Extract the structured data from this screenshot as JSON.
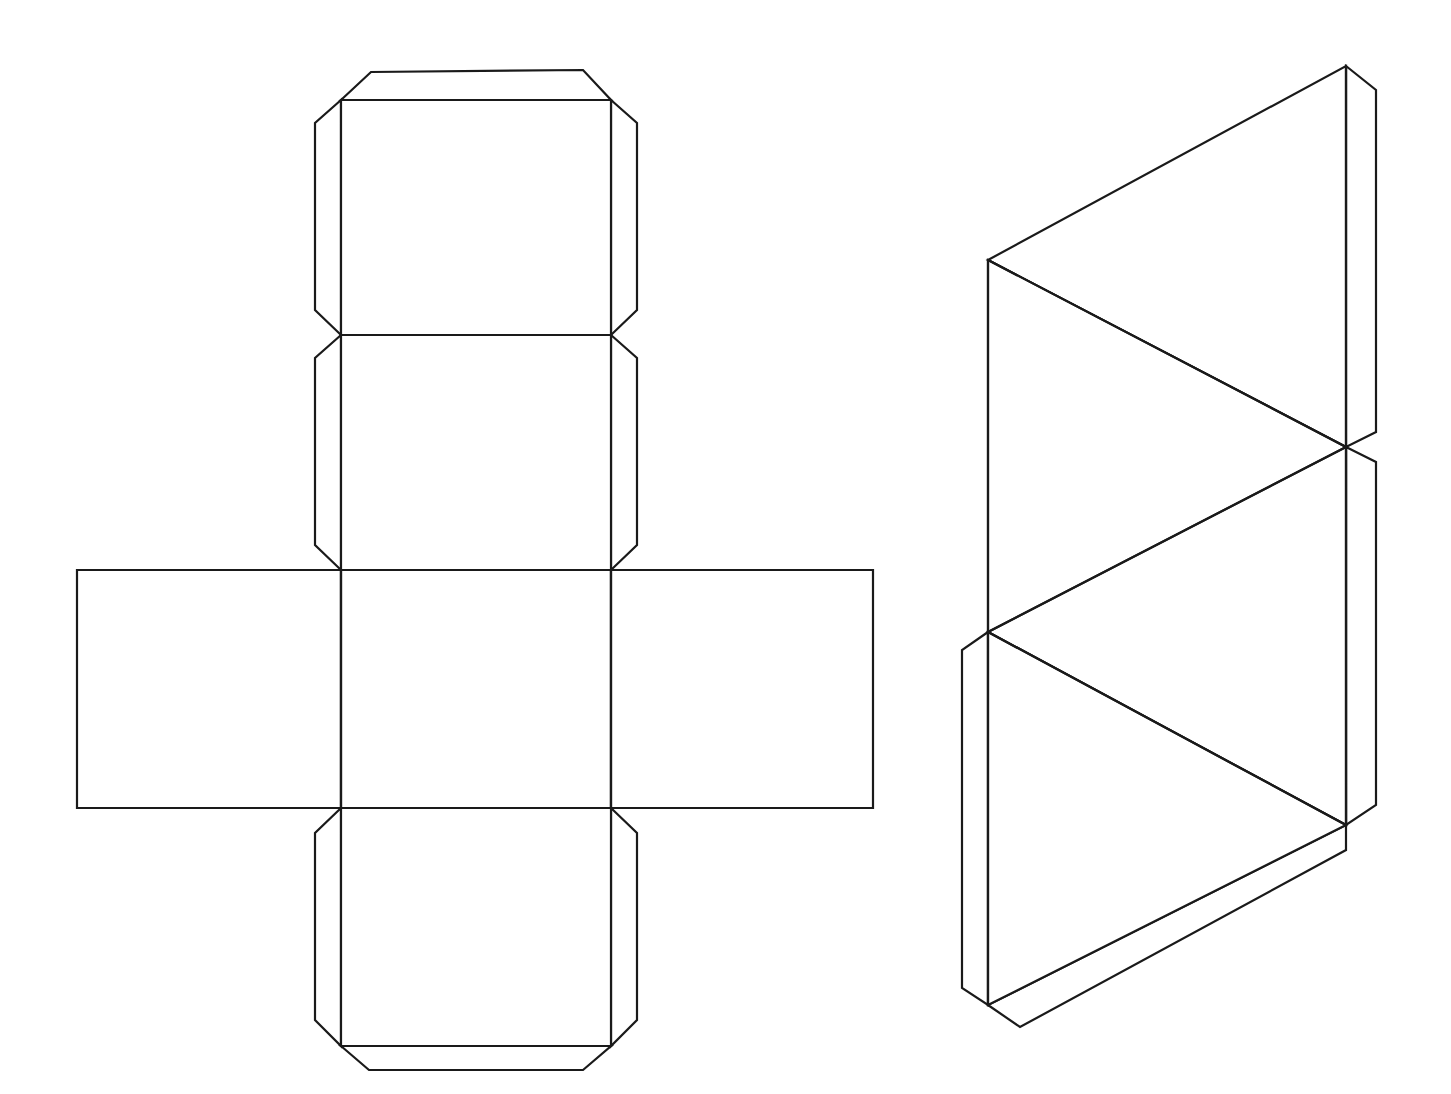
{
  "page": {
    "width": 1451,
    "height": 1094,
    "background_color": "#ffffff",
    "line_color": "#1a1a1a",
    "fill_color": "#ffffff"
  },
  "figures": [
    {
      "id": "cube-net",
      "name": "Cube Net",
      "shape": "cross-shaped cube net",
      "face_count": 6,
      "stroke_width": 2.2,
      "faces": [
        {
          "id": "cube-face-top",
          "name": "top-square",
          "points": "341,100 611,100 611,335 341,335"
        },
        {
          "id": "cube-face-upper-middle",
          "name": "upper-middle-square",
          "points": "341,335 611,335 611,570 341,570"
        },
        {
          "id": "cube-face-left",
          "name": "left-square",
          "points": "77,570 341,570 341,808 77,808"
        },
        {
          "id": "cube-face-center",
          "name": "center-square",
          "points": "341,570 611,570 611,808 341,808"
        },
        {
          "id": "cube-face-right",
          "name": "right-square",
          "points": "611,570 873,570 873,808 611,808"
        },
        {
          "id": "cube-face-bottom",
          "name": "bottom-square",
          "points": "341,808 611,808 611,1046 341,1046"
        }
      ],
      "tabs": [
        {
          "id": "cube-tab-top",
          "name": "top-glue-tab",
          "points": "341,100 371,72 583,70 611,100"
        },
        {
          "id": "cube-tab-top-left",
          "name": "top-left-glue-tab",
          "points": "341,100 315,123 315,310 341,335"
        },
        {
          "id": "cube-tab-top-right",
          "name": "top-right-glue-tab",
          "points": "611,100 637,123 637,310 611,335"
        },
        {
          "id": "cube-tab-upper-left",
          "name": "upper-middle-left-glue-tab",
          "points": "341,335 315,358 315,545 341,570"
        },
        {
          "id": "cube-tab-upper-right",
          "name": "upper-middle-right-glue-tab",
          "points": "611,335 637,358 637,545 611,570"
        },
        {
          "id": "cube-tab-bottom-left",
          "name": "bottom-left-glue-tab",
          "points": "341,808 315,833 315,1020 341,1046"
        },
        {
          "id": "cube-tab-bottom-right",
          "name": "bottom-right-glue-tab",
          "points": "611,808 637,833 637,1020 611,1046"
        },
        {
          "id": "cube-tab-bottom",
          "name": "bottom-glue-tab",
          "points": "341,1046 369,1070 583,1070 611,1046"
        }
      ],
      "fold_lines": [
        {
          "id": "cube-fold-1",
          "name": "fold-line-top-to-upper-middle",
          "points": "341,335 611,335"
        },
        {
          "id": "cube-fold-2",
          "name": "fold-line-upper-middle-to-center",
          "points": "341,570 611,570"
        },
        {
          "id": "cube-fold-3",
          "name": "fold-line-center-to-bottom",
          "points": "341,808 611,808"
        },
        {
          "id": "cube-fold-4",
          "name": "fold-line-left-vertical",
          "points": "341,570 341,808"
        },
        {
          "id": "cube-fold-5",
          "name": "fold-line-right-vertical",
          "points": "611,570 611,808"
        }
      ]
    },
    {
      "id": "prism-net",
      "name": "Triangular Prism Net",
      "shape": "zigzag triangular prism net",
      "face_count": 5,
      "stroke_width": 2.2,
      "faces": [
        {
          "id": "prism-face-top-triangle",
          "name": "top-triangle",
          "points": "988,260 1346,66 1346,447"
        },
        {
          "id": "prism-face-upper-rect",
          "name": "upper-rectangle",
          "points": "988,260 1346,447 1346,825 988,632"
        },
        {
          "id": "prism-face-bottom-triangle",
          "name": "bottom-triangle",
          "points": "988,632 1346,447 1346,825"
        },
        {
          "id": "prism-face-lower-rect",
          "name": "lower-rectangle",
          "points": "988,632 1346,825 988,1005"
        }
      ],
      "tabs": [
        {
          "id": "prism-tab-right-upper",
          "name": "right-upper-glue-tab",
          "points": "1346,66 1376,90 1376,432 1346,447"
        },
        {
          "id": "prism-tab-right-lower",
          "name": "right-lower-glue-tab",
          "points": "1346,447 1376,462 1376,805 1346,825"
        },
        {
          "id": "prism-tab-left-lower",
          "name": "left-lower-glue-tab",
          "points": "988,632 962,650 962,988 988,1005"
        },
        {
          "id": "prism-tab-bottom",
          "name": "bottom-edge-glue-tab",
          "points": "988,1005 1020,1027 1346,850 1346,825"
        }
      ],
      "fold_lines": [
        {
          "id": "prism-fold-1",
          "name": "fold-line-top-triangle-hypotenuse",
          "points": "988,260 1346,447"
        },
        {
          "id": "prism-fold-2",
          "name": "fold-line-upper-rect-diagonal",
          "points": "988,632 1346,447"
        },
        {
          "id": "prism-fold-3",
          "name": "fold-line-bottom-triangle-diagonal",
          "points": "988,632 1346,825"
        },
        {
          "id": "prism-fold-4",
          "name": "fold-line-left-vertical-upper",
          "points": "988,260 988,632"
        },
        {
          "id": "prism-fold-5",
          "name": "fold-line-left-vertical-lower",
          "points": "988,632 988,1005"
        },
        {
          "id": "prism-fold-6",
          "name": "fold-line-right-vertical-upper",
          "points": "1346,66 1346,447"
        },
        {
          "id": "prism-fold-7",
          "name": "fold-line-right-vertical-lower",
          "points": "1346,447 1346,825"
        }
      ]
    }
  ]
}
